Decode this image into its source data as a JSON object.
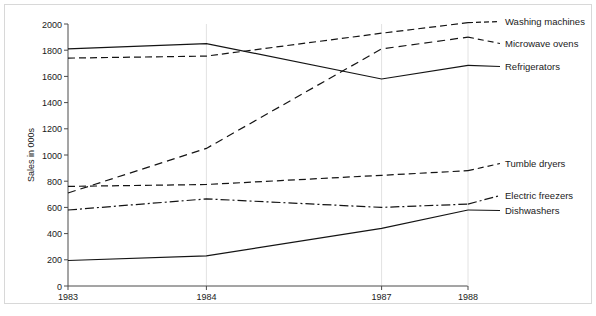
{
  "chart_data": {
    "type": "line",
    "title": "",
    "xlabel": "",
    "ylabel": "Sales in 000s",
    "x": [
      1983,
      1984,
      1987,
      1988
    ],
    "categories": [
      "1983",
      "1984",
      "1987",
      "1988"
    ],
    "xtick_labels": [
      "1983",
      "1984",
      "1987",
      "1988"
    ],
    "ytick_labels": [
      "0",
      "200",
      "400",
      "600",
      "800",
      "1000",
      "1200",
      "1400",
      "1600",
      "1800",
      "2000"
    ],
    "ytick_values": [
      0,
      200,
      400,
      600,
      800,
      1000,
      1200,
      1400,
      1600,
      1800,
      2000
    ],
    "ylim": [
      0,
      2000
    ],
    "xlim": [
      1983,
      1988
    ],
    "grid": "vertical-only",
    "legend_position": "right-inline-labels",
    "series": [
      {
        "name": "Washing machines",
        "style": "dashed",
        "values": [
          1740,
          1755,
          1930,
          2010
        ]
      },
      {
        "name": "Microwave ovens",
        "style": "fine-dashed",
        "values": [
          710,
          1050,
          1810,
          1900
        ]
      },
      {
        "name": "Refrigerators",
        "style": "solid",
        "values": [
          1810,
          1850,
          1580,
          1685
        ]
      },
      {
        "name": "Tumble dryers",
        "style": "dashed",
        "values": [
          760,
          775,
          845,
          880
        ]
      },
      {
        "name": "Electric freezers",
        "style": "dash-dot",
        "values": [
          580,
          665,
          600,
          625
        ]
      },
      {
        "name": "Dishwashers",
        "style": "solid",
        "values": [
          195,
          230,
          440,
          580
        ]
      }
    ]
  },
  "axes": {
    "ylabel": "Sales in 000s"
  },
  "labels": {
    "washing_machines": "Washing machines",
    "microwave_ovens": "Microwave ovens",
    "refrigerators": "Refrigerators",
    "tumble_dryers": "Tumble dryers",
    "electric_freezers": "Electric freezers",
    "dishwashers": "Dishwashers"
  },
  "xticks": {
    "t0": "1983",
    "t1": "1984",
    "t2": "1987",
    "t3": "1988"
  },
  "yticks": {
    "y0": "0",
    "y200": "200",
    "y400": "400",
    "y600": "600",
    "y800": "800",
    "y1000": "1000",
    "y1200": "1200",
    "y1400": "1400",
    "y1600": "1600",
    "y1800": "1800",
    "y2000": "2000"
  },
  "colors": {
    "line": "#141414",
    "axis": "#4a4a4a",
    "grid": "#e2e2e2",
    "frame": "#d8d8d8",
    "background": "#ffffff"
  }
}
